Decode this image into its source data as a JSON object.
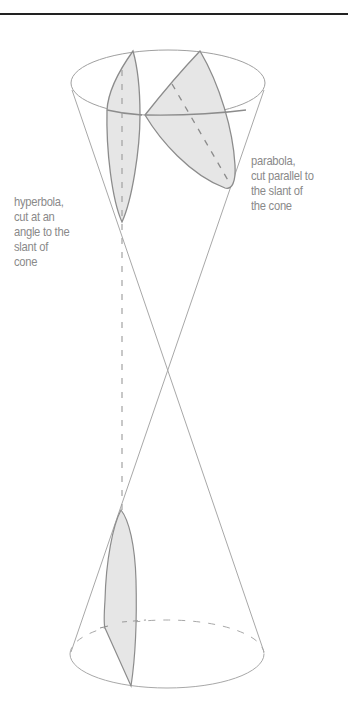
{
  "diagram": {
    "colors": {
      "background": "#ffffff",
      "top_rule": "#222222",
      "cone_line": "#a8a8a8",
      "section_outline": "#8c8c8c",
      "section_fill": "#e6e6e6",
      "label_text": "#8a8a8a"
    },
    "labels": {
      "parabola": {
        "lines": [
          "parabola,",
          "cut parallel to",
          "the slant of",
          "the cone"
        ]
      },
      "hyperbola": {
        "lines": [
          "hyperbola,",
          "cut at an",
          "angle to the",
          "slant of",
          "cone"
        ]
      }
    },
    "geometry": {
      "apex": [
        167,
        367
      ],
      "top_ellipse": {
        "cx": 168,
        "cy": 83,
        "rx": 97,
        "ry": 33
      },
      "bottom_ellipse": {
        "cx": 167,
        "cy": 654,
        "rx": 97,
        "ry": 34
      }
    }
  }
}
